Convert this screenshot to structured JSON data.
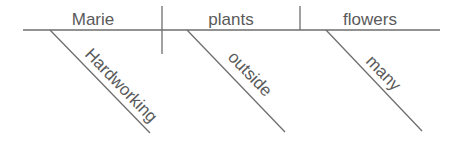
{
  "diagram": {
    "type": "sentence-diagram",
    "color": "#5a5a5a",
    "line_color": "#6e6e6e",
    "baseline": {
      "subject": "Marie",
      "verb": "plants",
      "object": "flowers"
    },
    "modifiers": [
      {
        "word": "Hardworking",
        "modifies": "Marie"
      },
      {
        "word": "outside",
        "modifies": "plants"
      },
      {
        "word": "many",
        "modifies": "flowers"
      }
    ]
  }
}
